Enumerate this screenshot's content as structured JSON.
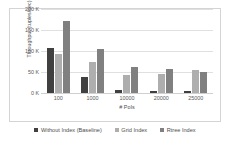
{
  "chart_data": {
    "type": "bar",
    "title": "",
    "xlabel": "# PoIs",
    "ylabel": "Throughput (tuples/sec)",
    "categories": [
      "100",
      "1000",
      "10000",
      "20000",
      "25000"
    ],
    "series": [
      {
        "name": "Without Index (Baseline)",
        "color": "#404040",
        "values": [
          108000,
          39000,
          8000,
          5000,
          4000
        ]
      },
      {
        "name": "Grid Index",
        "color": "#aeaeae",
        "values": [
          93000,
          75000,
          44000,
          45000,
          54000
        ]
      },
      {
        "name": "Rtree Index",
        "color": "#808080",
        "values": [
          172000,
          104000,
          62000,
          58000,
          51000
        ]
      }
    ],
    "ylim": [
      0,
      200000
    ],
    "yticks": [
      0,
      50000,
      100000,
      150000,
      200000
    ],
    "ytick_labels": [
      "0 K",
      "50 K",
      "100 K",
      "150 K",
      "200 K"
    ],
    "grid": true,
    "legend_position": "bottom"
  }
}
